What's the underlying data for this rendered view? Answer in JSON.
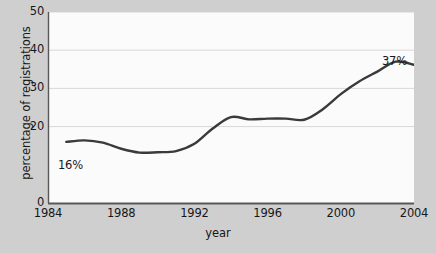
{
  "figure": {
    "background_color": "#cfcfcf",
    "plot_background_color": "#fbfbfb",
    "line_color": "#3a3a3c",
    "grid_color": "#d8d8d8",
    "axis_color": "#58585a",
    "text_color": "#17171a"
  },
  "chart_data": {
    "type": "line",
    "title": "",
    "xlabel": "year",
    "ylabel": "percentage of registrations",
    "xlim": [
      1984,
      2004
    ],
    "ylim": [
      0,
      50
    ],
    "grid": true,
    "grid_axis": "y",
    "legend": false,
    "legend_position": "none",
    "ytick_labels": [
      "0",
      "20",
      "30",
      "40",
      "50"
    ],
    "ytick_values": [
      0,
      20,
      30,
      40,
      50
    ],
    "gridline_values": [
      20,
      30,
      40,
      50
    ],
    "xtick_labels": [
      "1984",
      "1988",
      "1992",
      "1996",
      "2000",
      "2004"
    ],
    "xtick_values": [
      1984,
      1988,
      1992,
      1996,
      2000,
      2004
    ],
    "series": [
      {
        "name": "percentage of registrations",
        "x": [
          1985,
          1986,
          1987,
          1988,
          1989,
          1990,
          1991,
          1992,
          1993,
          1994,
          1995,
          1996,
          1997,
          1998,
          1999,
          2000,
          2001,
          2002,
          2003,
          2004
        ],
        "values": [
          16,
          16.4,
          15.8,
          14.2,
          13.2,
          13.3,
          13.6,
          15.5,
          19.5,
          22.5,
          21.9,
          22.1,
          22.1,
          21.8,
          24.5,
          28.5,
          31.8,
          34.4,
          37,
          36.2
        ]
      }
    ],
    "annotations": [
      {
        "text": "16%",
        "x": 1985,
        "y": 16,
        "position": "above-left"
      },
      {
        "text": "37%",
        "x": 2003,
        "y": 37,
        "position": "above"
      }
    ]
  }
}
